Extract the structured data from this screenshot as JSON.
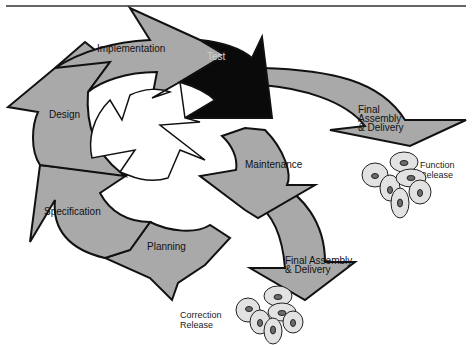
{
  "diagram": {
    "type": "cycle",
    "header_rule": true,
    "colors": {
      "arrow_fill": "#a9a9a9",
      "highlight_fill": "#0a0a0a",
      "outline": "#111111",
      "background": "#ffffff"
    },
    "stages": [
      {
        "id": "implementation",
        "label": "Implementation",
        "highlight": false
      },
      {
        "id": "test",
        "label": "Test",
        "highlight": true
      },
      {
        "id": "maintenance",
        "label": "Maintenance",
        "highlight": false
      },
      {
        "id": "planning",
        "label": "Planning",
        "highlight": false
      },
      {
        "id": "specification",
        "label": "Specification",
        "highlight": false
      },
      {
        "id": "design",
        "label": "Design",
        "highlight": false
      }
    ],
    "branches": [
      {
        "id": "delivery-function",
        "label_lines": [
          "Final",
          "Assembly",
          "& Delivery"
        ],
        "from": "test",
        "release_lines": [
          "Function",
          "Release"
        ]
      },
      {
        "id": "delivery-correction",
        "label_lines": [
          "Final Assembly",
          "& Delivery"
        ],
        "from": "maintenance",
        "release_lines": [
          "Correction",
          "Release"
        ]
      }
    ],
    "release_icon": "cd-disc-stack-icon"
  }
}
